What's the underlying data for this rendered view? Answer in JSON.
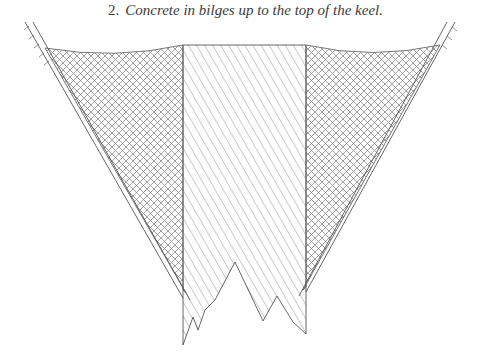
{
  "figure": {
    "number": "2.",
    "caption": "Concrete in bilges up to the top of the keel."
  },
  "diagram": {
    "type": "hull-cross-section",
    "regions": [
      {
        "name": "concrete-bilge-left",
        "pattern": "crosshatch"
      },
      {
        "name": "keel",
        "pattern": "diagonal-hatch"
      },
      {
        "name": "concrete-bilge-right",
        "pattern": "crosshatch"
      }
    ],
    "colors": {
      "line": "#555555",
      "hatch": "#7a7a7a",
      "text": "#3a3a3a"
    }
  }
}
